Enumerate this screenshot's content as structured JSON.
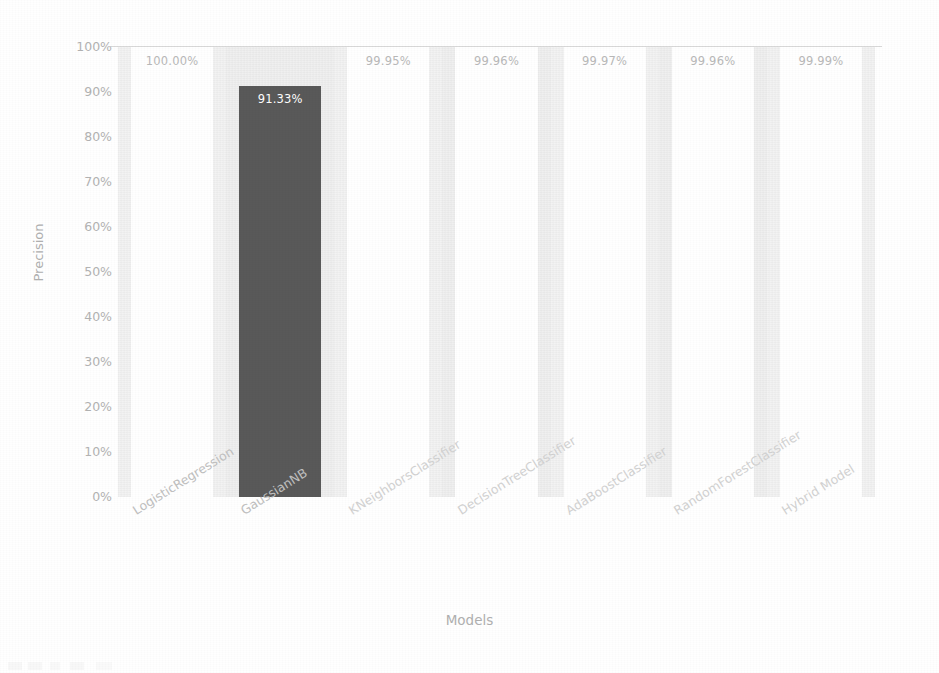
{
  "chart_data": {
    "type": "bar",
    "title": "",
    "xlabel": "Models",
    "ylabel": "Precision",
    "ylim": [
      0,
      100
    ],
    "grid": false,
    "legend": null,
    "categories": [
      "LogisticRegression",
      "GaussianNB",
      "KNeighborsClassifier",
      "DecisionTreeClassifier",
      "AdaBoostClassifier",
      "RandomForestClassifier",
      "Hybrid Model"
    ],
    "values": [
      100.0,
      91.33,
      99.95,
      99.96,
      99.97,
      99.96,
      99.99
    ],
    "value_labels": [
      "100.00%",
      "91.33%",
      "99.95%",
      "99.96%",
      "99.97%",
      "99.96%",
      "99.99%"
    ],
    "ytick_labels": [
      "100%",
      "90%",
      "80%",
      "70%",
      "60%",
      "50%",
      "40%",
      "30%",
      "20%",
      "10%",
      "0%"
    ],
    "ytick_values": [
      100,
      90,
      80,
      70,
      60,
      50,
      40,
      30,
      20,
      10,
      0
    ],
    "bar_colors": [
      "#ffffff",
      "#595959",
      "#ffffff",
      "#ffffff",
      "#ffffff",
      "#ffffff",
      "#ffffff"
    ],
    "label_inside_bar": [
      false,
      true,
      false,
      false,
      false,
      false,
      false
    ],
    "plot_background": "#f3f3f3",
    "axis_text_color": "#b3b3b3",
    "highlight_color": "#595959"
  }
}
